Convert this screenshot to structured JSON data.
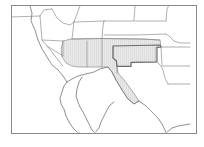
{
  "figure": {
    "kind": "thumbnail-map",
    "caption": "",
    "width": 204,
    "height": 147
  },
  "frame": {
    "name": "map-border",
    "x": 11,
    "y": 5,
    "width": 185,
    "height": 128,
    "stroke": "#8a8a8a",
    "stroke_width": 1,
    "fill": "#ffffff"
  },
  "style": {
    "background": "#ffffff",
    "state_border_color": "#8e8e8e",
    "coastline_color": "#7c7c7c",
    "highlight_fill": "#e6e6e6",
    "highlight_stroke": "#9a9a9a",
    "highlight_outline_color": "#6d6d6d",
    "hatch_color": "#d2d2d2",
    "state_border_width": 0.7,
    "coastline_width": 0.8
  },
  "highlight": {
    "label": "highlighted-region",
    "description": "Shaded southwestern states block",
    "fill": "#e6e6e6",
    "states": [
      "Arizona",
      "New Mexico",
      "Colorado",
      "Kansas",
      "Oklahoma",
      "Texas"
    ],
    "outline_path": "M63,41 L71,39 L102,38.5 L142,39 L160,40 L161,47 L156,47 L156,62 L131,62 L131,66 L117,66 L118,73 L124,80 L130,88 L135,95 L139,101 L134,104 L128,99 L122,90 L116,80 L112,72 L108,67 L100,67 L92,67 L86,67 L78,67 L72,66 L66,63 L62,57 L61,49 Z",
    "hatch": {
      "pattern": "vertical-lines",
      "spacing": 2,
      "color": "#d4d4d4"
    }
  },
  "outline_overlays": [
    {
      "name": "oklahoma-outline",
      "path": "M113,46 L160,45 L161,47 L157,47.5 L157,62 L131,62.5 L131,66.5 L117,66.5 L116.5,61 L113,58 Z",
      "stroke": "#6a6a6a",
      "width": 1.1
    }
  ],
  "geography": {
    "state_borders": [
      {
        "name": "ca-or-nv-north",
        "path": "M11,17 L40,16"
      },
      {
        "name": "nv-ca-border",
        "path": "M40,16 L42,40 L47,46 L63,56"
      },
      {
        "name": "nv-ut-border",
        "path": "M42,40 L63,41"
      },
      {
        "name": "or-id-border",
        "path": "M40,16 L44,10 L52,9"
      },
      {
        "name": "id-mt-border",
        "path": "M52,9 L57,18 L63,23 L70,25 L74,22 L78,11 L80,6"
      },
      {
        "name": "id-wy-ut-border",
        "path": "M74,22 L72,39 L71,41"
      },
      {
        "name": "ut-az-border",
        "path": "M63,41 L63,56"
      },
      {
        "name": "az-ca-border",
        "path": "M47,46 L52,52 L58,60 L63,66"
      },
      {
        "name": "az-nm-border",
        "path": "M87,41 L87,67"
      },
      {
        "name": "wy-co-border",
        "path": "M72,39 L102,38.5"
      },
      {
        "name": "wy-ne-border",
        "path": "M102,38.5 L103,26 L104,21"
      },
      {
        "name": "mt-wy-border",
        "path": "M74,22 L104,21"
      },
      {
        "name": "mt-nd-sd-border",
        "path": "M104,21 L134,21 L135,6"
      },
      {
        "name": "nd-sd-border",
        "path": "M135,21 L166,21"
      },
      {
        "name": "sd-ne-border",
        "path": "M104,35 L136,35 L166,34"
      },
      {
        "name": "ne-ks-border",
        "path": "M103,38.5 L142,39 L160,40"
      },
      {
        "name": "nd-mn-border",
        "path": "M166,21 L167,9 L169,5"
      },
      {
        "name": "sd-ia-border",
        "path": "M166,34 L170,37 L174,41"
      },
      {
        "name": "ia-mo-border",
        "path": "M174,41 L180,43 L190,43"
      },
      {
        "name": "ks-mo-border",
        "path": "M160,45 L161,47 L175,47 L190,47"
      },
      {
        "name": "mo-ar-border",
        "path": "M163,66 L190,66"
      },
      {
        "name": "ar-la-border",
        "path": "M168,84 L190,84"
      },
      {
        "name": "ok-ar-border",
        "path": "M161,47 L162,66"
      },
      {
        "name": "tx-ar-la-border",
        "path": "M157,62 L161,66 L163,70 L165,78 L168,84"
      },
      {
        "name": "co-ks-nm-border",
        "path": "M102,38.5 L102,67"
      },
      {
        "name": "nm-tx-border",
        "path": "M117,66 L117,73"
      },
      {
        "name": "nm-ok-tx-panhandle",
        "path": "M113,46 L113,58 L116,61 L117,66"
      }
    ],
    "coastlines": [
      {
        "name": "pacific-coast-california",
        "path": "M30,6 L32,13 L31,21 L35,30 L38,40 L42,49 L47,57 L52,65 L58,70 L63,76 L67,82"
      },
      {
        "name": "baja-california-peninsula",
        "path": "M67,82 L64,86 L62,92 L60,98 L61,104 L64,109 L66,116 L69,122 L73,128 L77,132 L80,133"
      },
      {
        "name": "gulf-of-california-east",
        "path": "M82,77 L79,82 L77,89 L76,96 L78,102 L80,107 L83,112 L86,118 L89,124 L92,130 L95,133"
      },
      {
        "name": "mexico-mainland-coast",
        "path": "M95,133 L99,128 L101,122 L104,116 L107,110 L110,105 L114,102"
      },
      {
        "name": "gulf-coast-texas",
        "path": "M139,101 L146,106 L152,112 L158,118 L162,124 L165,130 L166,133"
      },
      {
        "name": "gulf-coast-louisiana",
        "path": "M166,133 L172,128 L178,126 L184,125 L190,124"
      }
    ],
    "mexico_border": {
      "name": "us-mexico-border",
      "path": "M67,82 L72,79 L78,76 L86,74 L94,72 L100,69 L108,67 L112,72 L116,80 L122,90 L128,99 L134,104 L139,101"
    }
  },
  "accessibility": {
    "alt_text": "Small outline map of the western and central United States with Arizona, New Mexico, Colorado, Kansas, Oklahoma and part of Texas shaded light gray, enclosed in a thin rectangular border."
  }
}
